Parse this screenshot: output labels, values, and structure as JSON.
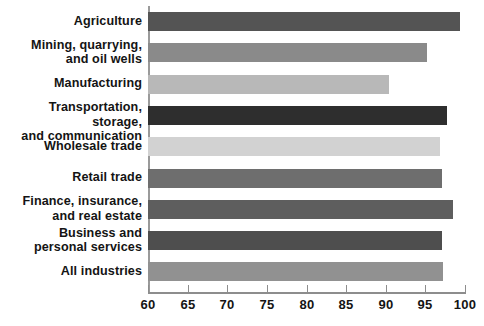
{
  "chart_data": {
    "type": "bar",
    "orientation": "horizontal",
    "title": "",
    "subtitle": "",
    "xlabel": "",
    "ylabel": "",
    "xlim": [
      60,
      100
    ],
    "ylim": null,
    "grid": false,
    "legend": null,
    "xticks": [
      60,
      65,
      70,
      75,
      80,
      85,
      90,
      95,
      100
    ],
    "xtick_labels": [
      "60",
      "65",
      "70",
      "75",
      "80",
      "85",
      "90",
      "95",
      "100"
    ],
    "categories": [
      "Agriculture",
      "Mining, quarrying,\nand oil wells",
      "Manufacturing",
      "Transportation, storage,\nand communication",
      "Wholesale trade",
      "Retail trade",
      "Finance, insurance,\nand real estate",
      "Business and\npersonal services",
      "All industries"
    ],
    "values": [
      99.4,
      95.2,
      90.4,
      97.7,
      96.8,
      97.1,
      98.5,
      97.1,
      97.2
    ],
    "bar_colors": [
      "#545454",
      "#8a8a8a",
      "#b8b8b8",
      "#2e2e2e",
      "#d2d2d2",
      "#6e6e6e",
      "#5e5e5e",
      "#4e4e4e",
      "#919191"
    ],
    "axis_color": "#8d8d8d",
    "text_color": "#141414",
    "background_color": "#ffffff"
  }
}
